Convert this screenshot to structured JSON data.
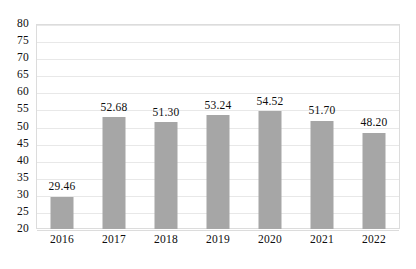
{
  "chart_data": {
    "type": "bar",
    "title": "",
    "subtitle": "",
    "xlabel": "",
    "ylabel": "",
    "categories": [
      "2016",
      "2017",
      "2018",
      "2019",
      "2020",
      "2021",
      "2022"
    ],
    "values": [
      29.46,
      52.68,
      51.3,
      53.24,
      54.52,
      51.7,
      48.2
    ],
    "data_labels": [
      "29.46",
      "52.68",
      "51.30",
      "53.24",
      "54.52",
      "51.70",
      "48.20"
    ],
    "ylim": [
      20,
      80
    ],
    "ytick_step": 5,
    "ytick_labels": [
      "80",
      "75",
      "70",
      "65",
      "60",
      "55",
      "50",
      "45",
      "40",
      "35",
      "30",
      "25",
      "20"
    ],
    "ytick_values": [
      80,
      75,
      70,
      65,
      60,
      55,
      50,
      45,
      40,
      35,
      30,
      25,
      20
    ],
    "grid": true,
    "legend": false,
    "legend_position": "none",
    "series": [
      {
        "name": "",
        "values": [
          29.46,
          52.68,
          51.3,
          53.24,
          54.52,
          51.7,
          48.2
        ]
      }
    ],
    "colors": {
      "bar": "#a6a6a6",
      "gridline": "#e8e8e8",
      "axis_border": "#dcdcdc",
      "text": "#0d0d0d",
      "background": "#ffffff"
    }
  }
}
